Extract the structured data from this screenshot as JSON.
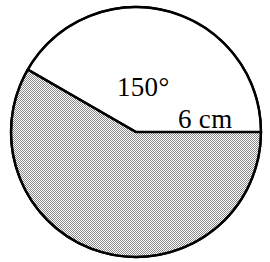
{
  "figure": {
    "name": "circle-sector-diagram",
    "type": "geometry-figure",
    "background_color": "#ffffff",
    "stroke_color": "#000000",
    "shaded_fill_color": "#b8b8b8",
    "unshaded_fill_color": "#ffffff",
    "stroke_width": 2.2,
    "circle": {
      "center_x": 136,
      "center_y": 132,
      "radius_px": 125
    },
    "sectors": [
      {
        "name": "unshaded-sector",
        "label": "150°",
        "angle_degrees": 150,
        "start_angle_degrees": 0,
        "end_angle_degrees": 150,
        "fill": "#ffffff"
      },
      {
        "name": "shaded-sector",
        "angle_degrees": 210,
        "start_angle_degrees": 150,
        "end_angle_degrees": 360,
        "fill": "#b8b8b8"
      }
    ],
    "radii": [
      {
        "name": "horizontal-radius",
        "label": "6 cm",
        "angle_degrees": 0,
        "length_label": "6 cm"
      },
      {
        "name": "angled-radius",
        "label": "",
        "angle_degrees": 150,
        "length_label": "6 cm"
      }
    ],
    "labels": {
      "angle": {
        "text": "150°",
        "x": 117,
        "y": 96
      },
      "radius": {
        "text": "6 cm",
        "x": 178,
        "y": 128
      }
    }
  }
}
